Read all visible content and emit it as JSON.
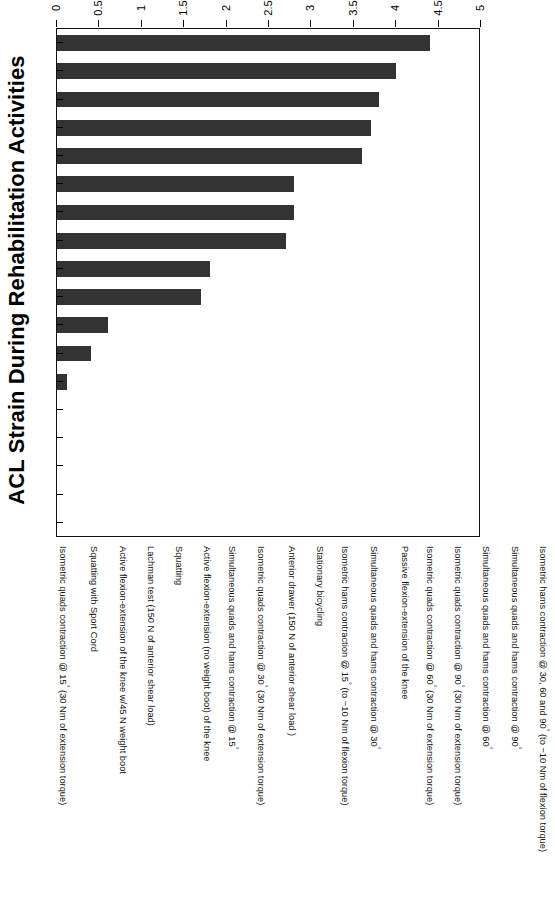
{
  "chart_data": {
    "type": "bar",
    "title": "ACL Strain During Rehabilitation Activities",
    "xlabel": "",
    "ylabel": "",
    "orientation": "vertical-bars-rotated-figure",
    "grid": false,
    "legend": null,
    "ylim": [
      0,
      5
    ],
    "ytick_labels": [
      "0",
      "0.5",
      "1",
      "1.5",
      "2",
      "2.5",
      "3",
      "3.5",
      "4",
      "4.5",
      "5"
    ],
    "ytick_values": [
      0,
      0.5,
      1,
      1.5,
      2,
      2.5,
      3,
      3.5,
      4,
      4.5,
      5
    ],
    "bar_color": "#333333",
    "categories": [
      "Isometric quads contraction @ 15° (30 Nm of extension torque)",
      "Squatting with Sport Cord",
      "Active flexion-extension of the knee w/45 N weight boot",
      "Lachman test (150 N of anterior shear load)",
      "Squatting",
      "Active flexion-extension (no weight boot) of the knee",
      "Simultaneous quads and hams contraction @ 15°",
      "Isometric quads contraction @ 30° (30 Nm of extension torque)",
      "Anterior drawer (150 N of anterior shear load )",
      "Stationary bicycling",
      "Isometric hams contraction @ 15° (to −10 Nm of flexion torque)",
      "Simultaneous quads and hams contraction @ 30°",
      "Passive flexion-extension of the knee",
      "Isometric quads contraction @ 60° (30 Nm of extension torque)",
      "Isometric quads contraction @ 90° (30 Nm of extension torque)",
      "Simultaneous quads and hams contraction @ 60°",
      "Simultaneous quads and hams contraction @ 90°",
      "Isometric hams contraction @ 30, 60 and 90° (to −10 Nm of flexion torque)"
    ],
    "values": [
      4.4,
      4.0,
      3.8,
      3.7,
      3.6,
      2.8,
      2.8,
      2.7,
      1.8,
      1.7,
      0.6,
      0.4,
      0.12,
      0,
      0,
      0,
      0,
      0
    ]
  }
}
